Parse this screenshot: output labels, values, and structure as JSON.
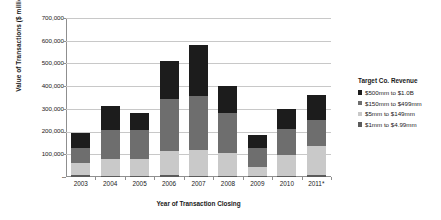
{
  "chart_data": {
    "type": "bar",
    "stacked": true,
    "title": "",
    "xlabel": "Year of Transaction Closing",
    "ylabel": "Value of Transactions ($ millions)",
    "categories": [
      "2003",
      "2004",
      "2005",
      "2006",
      "2007",
      "2008",
      "2009",
      "2010",
      "2011*"
    ],
    "ylim": [
      0,
      700000
    ],
    "ytick_labels": [
      "700,000",
      "600,000",
      "500,000",
      "400,000",
      "300,000",
      "200,000",
      "100,000",
      "-"
    ],
    "ytick_values": [
      700000,
      600000,
      500000,
      400000,
      300000,
      200000,
      100000,
      0
    ],
    "grid": true,
    "legend_position": "right",
    "legend_title": "Target Co. Revenue",
    "series": [
      {
        "name": "$1mm to $4.99mm",
        "color": "#5b5b5b",
        "values": [
          8000,
          6000,
          6000,
          7000,
          6000,
          6000,
          5000,
          5000,
          10000
        ]
      },
      {
        "name": "$5mm to $149mm",
        "color": "#c9c9c9",
        "values": [
          52000,
          74000,
          72000,
          108000,
          114000,
          99000,
          40000,
          90000,
          125000
        ]
      },
      {
        "name": "$150mm to $499mm",
        "color": "#6e6e6e",
        "values": [
          70000,
          125000,
          127000,
          230000,
          238000,
          175000,
          85000,
          115000,
          115000
        ]
      },
      {
        "name": "$500mm to $1.0B",
        "color": "#1c1c1c",
        "values": [
          63000,
          108000,
          75000,
          165000,
          222000,
          120000,
          53000,
          90000,
          110000
        ]
      }
    ],
    "totals": [
      193000,
      313000,
      280000,
      510000,
      580000,
      400000,
      183000,
      300000,
      360000
    ]
  },
  "legend": {
    "title": "Target Co. Revenue",
    "items": [
      {
        "label": "$500mm to $1.0B",
        "color": "#1c1c1c"
      },
      {
        "label": "$150mm to $499mm",
        "color": "#6e6e6e"
      },
      {
        "label": "$5mm to $149mm",
        "color": "#c9c9c9"
      },
      {
        "label": "$1mm to $4.99mm",
        "color": "#5b5b5b"
      }
    ]
  }
}
